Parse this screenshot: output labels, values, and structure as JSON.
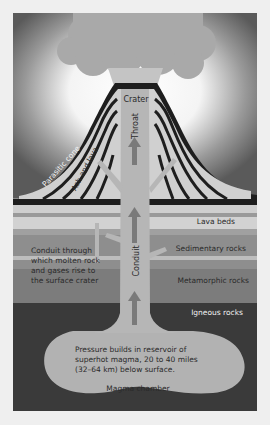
{
  "diagram": {
    "labels": {
      "crater": "Crater",
      "throat": "Throat",
      "parasitic_cone": "Parasitic cone",
      "ash_and_lava": "Ash and lava",
      "lava_beds": "Lava beds",
      "sedimentary_rocks": "Sedimentary rocks",
      "metamorphic_rocks": "Metamorphic rocks",
      "igneous_rocks": "Igneous rocks",
      "conduit": "Conduit",
      "conduit_note": [
        "Conduit through",
        "which molten rock",
        "and gases rise to",
        "the surface crater"
      ],
      "pressure_note": [
        "Pressure builds in reservoir of",
        "superhot magma, 20 to 40 miles",
        "(32–64 km) below surface."
      ],
      "magma_chamber": "Magma chamber"
    },
    "colors": {
      "sky_dark": "#5a5a5a",
      "sky_glow": "#ffffff",
      "plume": "#a8a8a8",
      "cone": "#cfcfcf",
      "cone_stripes": "#1e1e1e",
      "conduit": "#b5b5b5",
      "arrow": "#7a7a7a",
      "lava_beds": "#c8c8c8",
      "sedimentary": "#8e8e8e",
      "metamorphic": "#7c7c7c",
      "igneous": "#3a3a3a",
      "magma": "#b0b0b0"
    }
  }
}
